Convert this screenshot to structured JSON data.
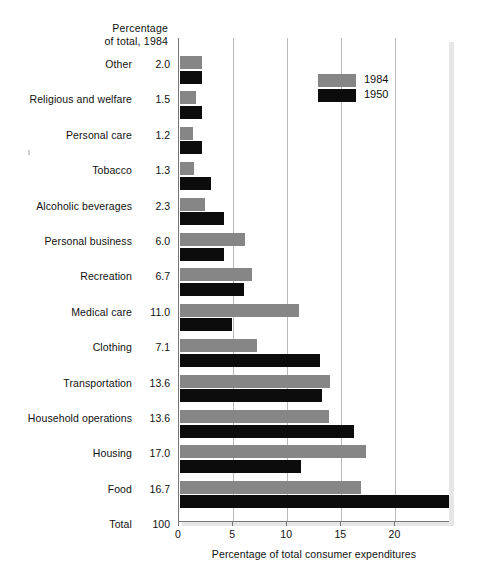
{
  "caption": {
    "line1": "Percentage",
    "line2": "of total, 1984"
  },
  "legend": {
    "entries": [
      {
        "label": "1984",
        "color": "#868686"
      },
      {
        "label": "1950",
        "color": "#0c0c0c"
      }
    ]
  },
  "axis": {
    "title": "Percentage of total consumer expenditures",
    "ticks": [
      "0",
      "5",
      "10",
      "15",
      "20"
    ],
    "tick_values": [
      0,
      5,
      10,
      15,
      20
    ],
    "min": 0,
    "max": 25
  },
  "rows": [
    {
      "label": "Other",
      "pct1984_text": "2.0",
      "v1984": 2.0,
      "v1950": 2.0
    },
    {
      "label": "Religious and welfare",
      "pct1984_text": "1.5",
      "v1984": 1.5,
      "v1950": 2.0
    },
    {
      "label": "Personal care",
      "pct1984_text": "1.2",
      "v1984": 1.2,
      "v1950": 2.0
    },
    {
      "label": "Tobacco",
      "pct1984_text": "1.3",
      "v1984": 1.3,
      "v1950": 2.9
    },
    {
      "label": "Alcoholic beverages",
      "pct1984_text": "2.3",
      "v1984": 2.3,
      "v1950": 4.1
    },
    {
      "label": "Personal business",
      "pct1984_text": "6.0",
      "v1984": 6.0,
      "v1950": 4.1
    },
    {
      "label": "Recreation",
      "pct1984_text": "6.7",
      "v1984": 6.7,
      "v1950": 5.9
    },
    {
      "label": "Medical care",
      "pct1984_text": "11.0",
      "v1984": 11.0,
      "v1950": 4.8
    },
    {
      "label": "Clothing",
      "pct1984_text": "7.1",
      "v1984": 7.1,
      "v1950": 12.9
    },
    {
      "label": "Transportation",
      "pct1984_text": "13.6",
      "v1984": 13.9,
      "v1950": 13.1
    },
    {
      "label": "Household operations",
      "pct1984_text": "13.6",
      "v1984": 13.8,
      "v1950": 16.1
    },
    {
      "label": "Housing",
      "pct1984_text": "17.0",
      "v1984": 17.2,
      "v1950": 11.2
    },
    {
      "label": "Food",
      "pct1984_text": "16.7",
      "v1984": 16.7,
      "v1950": 24.9
    },
    {
      "label": "Total",
      "pct1984_text": "100",
      "v1984": null,
      "v1950": null
    }
  ],
  "chart_data": {
    "type": "bar",
    "orientation": "horizontal",
    "title": "",
    "xlabel": "Percentage of total consumer expenditures",
    "ylabel": "",
    "xlim": [
      0,
      25
    ],
    "grid": true,
    "legend_position": "top-right",
    "categories": [
      "Other",
      "Religious and welfare",
      "Personal care",
      "Tobacco",
      "Alcoholic beverages",
      "Personal business",
      "Recreation",
      "Medical care",
      "Clothing",
      "Transportation",
      "Household operations",
      "Housing",
      "Food"
    ],
    "series": [
      {
        "name": "1984",
        "color": "#868686",
        "values": [
          2.0,
          1.5,
          1.2,
          1.3,
          2.3,
          6.0,
          6.7,
          11.0,
          7.1,
          13.6,
          13.6,
          17.0,
          16.7
        ]
      },
      {
        "name": "1950",
        "color": "#0c0c0c",
        "values": [
          2.0,
          2.0,
          2.0,
          2.9,
          4.1,
          4.1,
          5.9,
          4.8,
          12.9,
          13.1,
          16.1,
          11.2,
          24.9
        ]
      }
    ],
    "annotation_column": {
      "header": "Percentage of total, 1984",
      "values": [
        "2.0",
        "1.5",
        "1.2",
        "1.3",
        "2.3",
        "6.0",
        "6.7",
        "11.0",
        "7.1",
        "13.6",
        "13.6",
        "17.0",
        "16.7",
        "100"
      ],
      "value_labels": [
        "Other",
        "Religious and welfare",
        "Personal care",
        "Tobacco",
        "Alcoholic beverages",
        "Personal business",
        "Recreation",
        "Medical care",
        "Clothing",
        "Transportation",
        "Household operations",
        "Housing",
        "Food",
        "Total"
      ]
    }
  }
}
